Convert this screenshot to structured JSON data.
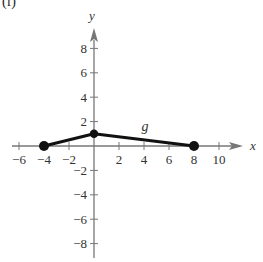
{
  "part_label": "(f)",
  "chart_data": {
    "type": "line",
    "title": "",
    "xlabel": "x",
    "ylabel": "y",
    "function_label": "g",
    "xlim": [
      -7,
      12
    ],
    "ylim": [
      -9,
      10
    ],
    "x_ticks": [
      -6,
      -4,
      -2,
      2,
      4,
      6,
      8,
      10
    ],
    "y_ticks": [
      8,
      6,
      4,
      2,
      -2,
      -4,
      -6,
      -8
    ],
    "x_tick_labels": [
      "−6",
      "−4",
      "−2",
      "2",
      "4",
      "6",
      "8",
      "10"
    ],
    "y_tick_labels": [
      "8",
      "6",
      "4",
      "2",
      "−2",
      "−4",
      "−6",
      "−8"
    ],
    "grid": false,
    "series": [
      {
        "name": "g",
        "points": [
          [
            -4,
            0
          ],
          [
            0,
            1
          ],
          [
            8,
            0
          ]
        ],
        "endpoints_closed": true
      }
    ],
    "colors": {
      "axis": "#777777",
      "line": "#111111",
      "text": "#333333"
    }
  }
}
